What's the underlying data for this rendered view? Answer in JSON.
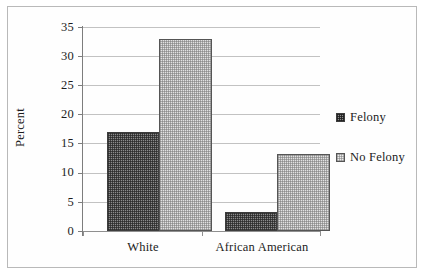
{
  "chart_data": {
    "type": "bar",
    "title": "",
    "xlabel": "",
    "ylabel": "Percent",
    "categories": [
      "White",
      "African American"
    ],
    "series": [
      {
        "name": "Felony",
        "values": [
          17,
          3.3
        ]
      },
      {
        "name": "No Felony",
        "values": [
          33,
          13.2
        ]
      }
    ],
    "ylim": [
      0,
      35
    ],
    "yticks": [
      0,
      5,
      10,
      15,
      20,
      25,
      30,
      35
    ],
    "ytick_labels": [
      "0",
      "5",
      "10",
      "15",
      "20",
      "25",
      "30",
      "35"
    ],
    "grid": true,
    "legend_position": "right"
  },
  "legend": {
    "items": [
      {
        "label": "Felony",
        "swatch": "felony-swatch-icon"
      },
      {
        "label": "No Felony",
        "swatch": "no-felony-swatch-icon"
      }
    ]
  },
  "axes": {
    "y_title": "Percent",
    "y_labels": [
      "35",
      "30",
      "25",
      "20",
      "15",
      "10",
      "5",
      "0"
    ],
    "x_labels": [
      "White",
      "African American"
    ]
  },
  "colors": {
    "felony_fill": "#8c8c8c",
    "no_felony_fill": "#e2e2e2",
    "gridline": "#c2c2c2",
    "axis": "#7d7d7d",
    "text": "#1c1c1c",
    "frame": "#b9b9b9"
  }
}
